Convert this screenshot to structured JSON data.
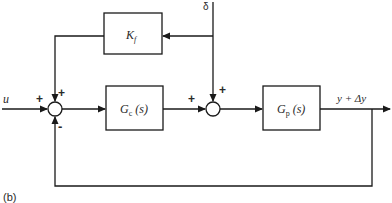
{
  "diagram": {
    "caption": "(b)",
    "input_label": "u",
    "disturbance_label": "δ",
    "output_label": "y + Δy",
    "blocks": {
      "feedforward": {
        "name": "K",
        "sub": "f"
      },
      "controller": {
        "name": "G",
        "sub": "c",
        "arg": "(s)"
      },
      "plant": {
        "name": "G",
        "sub": "p",
        "arg": "(s)"
      }
    },
    "junction1_signs": {
      "input": "+",
      "top": "+",
      "bottom": "-"
    },
    "junction2_signs": {
      "left": "+",
      "top": "+"
    },
    "line_color": "#1a1a1a"
  }
}
